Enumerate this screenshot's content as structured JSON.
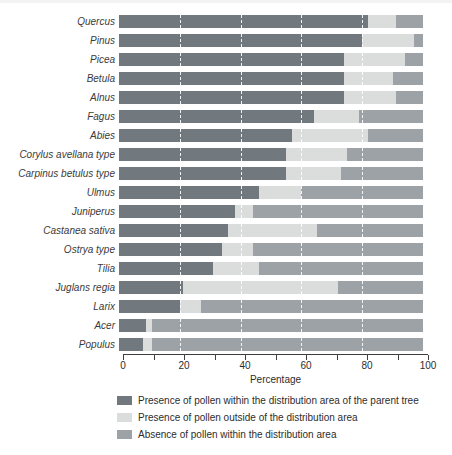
{
  "chart_data": {
    "type": "bar",
    "orientation": "horizontal",
    "stacked": true,
    "title": "",
    "xlabel": "Percentage",
    "xlim": [
      0,
      100
    ],
    "x_major_ticks": [
      0,
      20,
      40,
      60,
      80,
      100
    ],
    "x_minor_ticks": [
      10,
      30,
      50,
      70,
      90
    ],
    "x_tick_labels": [
      "0",
      "20",
      "40",
      "60",
      "80",
      "100"
    ],
    "gridlines_pct": [
      20,
      40,
      60,
      80
    ],
    "gridline_style": "white-dashed-over-bars",
    "legend_position": "bottom-left",
    "categories": [
      "Quercus",
      "Pinus",
      "Picea",
      "Betula",
      "Alnus",
      "Fagus",
      "Abies",
      "Corylus avellana type",
      "Carpinus betulus type",
      "Ulmus",
      "Juniperus",
      "Castanea sativa",
      "Ostrya type",
      "Tilia",
      "Juglans regia",
      "Larix",
      "Acer",
      "Populus"
    ],
    "series": [
      {
        "name": "Presence of pollen within the distribution area of the parent tree",
        "color": "#71797f",
        "values": [
          82,
          80,
          74,
          74,
          74,
          64,
          57,
          55,
          55,
          46,
          38,
          36,
          34,
          31,
          21,
          20,
          9,
          8
        ]
      },
      {
        "name": "Presence of pollen outside of the distribution area",
        "color": "#dadddb",
        "values": [
          9,
          17,
          20,
          16,
          17,
          15,
          25,
          20,
          18,
          14,
          6,
          29,
          10,
          15,
          51,
          7,
          2,
          3
        ]
      },
      {
        "name": "Absence of pollen within the distribution area",
        "color": "#9ca2a5",
        "values": [
          9,
          3,
          6,
          10,
          9,
          21,
          18,
          25,
          27,
          40,
          56,
          35,
          56,
          54,
          28,
          73,
          89,
          89
        ]
      }
    ]
  },
  "colors": {
    "axis_line": "#3f3f3f",
    "text": "#2d2d2d",
    "category_label": "#3b3b3b",
    "top_band": "#f3f3f3"
  }
}
